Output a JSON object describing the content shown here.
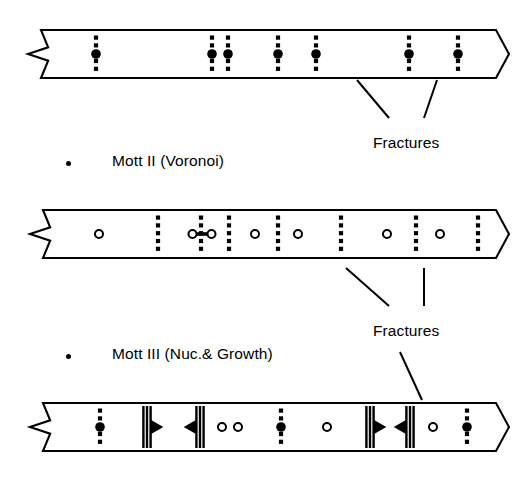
{
  "figure": {
    "background_color": "#ffffff",
    "ink_color": "#000000",
    "width": 521,
    "height": 487
  },
  "labels": {
    "model2": "Mott II  (Voronoi)",
    "model3": "Mott III  (Nuc.& Growth)",
    "fracture_upper": "Fractures",
    "fracture_lower": "Fractures"
  },
  "bands": [
    {
      "id": "band-1",
      "name": "mott-i-band",
      "model": "Mott I",
      "x": 28,
      "y": 30,
      "width": 468,
      "height": 48,
      "left_end": "zigzag-break",
      "right_end": "chevron-break",
      "markers": [
        {
          "type": "dotted-line-with-filled-circle",
          "x": 68
        },
        {
          "type": "dotted-line-with-filled-circle",
          "x": 184
        },
        {
          "type": "dotted-line-with-filled-circle",
          "x": 200
        },
        {
          "type": "dotted-line-with-filled-circle",
          "x": 250
        },
        {
          "type": "dotted-line-with-filled-circle",
          "x": 288
        },
        {
          "type": "dotted-line-with-filled-circle",
          "x": 381
        },
        {
          "type": "dotted-line-with-filled-circle",
          "x": 430
        }
      ]
    },
    {
      "id": "band-2",
      "name": "mott-ii-band",
      "model": "Mott II (Voronoi)",
      "x": 30,
      "y": 210,
      "width": 466,
      "height": 48,
      "left_end": "zigzag-break",
      "right_end": "chevron-break",
      "markers": [
        {
          "type": "open-circle",
          "x": 69
        },
        {
          "type": "dotted-line",
          "x": 128
        },
        {
          "type": "open-circle-pair-linked",
          "x": 172
        },
        {
          "type": "dotted-line",
          "x": 171
        },
        {
          "type": "dotted-line",
          "x": 199
        },
        {
          "type": "open-circle",
          "x": 225
        },
        {
          "type": "dotted-line",
          "x": 248
        },
        {
          "type": "open-circle",
          "x": 268
        },
        {
          "type": "dotted-line",
          "x": 311
        },
        {
          "type": "open-circle",
          "x": 357
        },
        {
          "type": "dotted-line",
          "x": 386
        },
        {
          "type": "open-circle",
          "x": 410
        },
        {
          "type": "dotted-line",
          "x": 448
        }
      ]
    },
    {
      "id": "band-3",
      "name": "mott-iii-band",
      "model": "Mott III (Nuc.& Growth)",
      "x": 30,
      "y": 403,
      "width": 466,
      "height": 48,
      "left_end": "zigzag-break",
      "right_end": "chevron-break",
      "markers": [
        {
          "type": "dotted-line-with-filled-circle",
          "x": 70
        },
        {
          "type": "bar-arrow-right",
          "x": 117
        },
        {
          "type": "bar-arrow-left",
          "x": 170
        },
        {
          "type": "open-circle",
          "x": 192
        },
        {
          "type": "open-circle",
          "x": 208
        },
        {
          "type": "dotted-line-with-filled-circle",
          "x": 251
        },
        {
          "type": "open-circle",
          "x": 297
        },
        {
          "type": "bar-arrow-right",
          "x": 340
        },
        {
          "type": "bar-arrow-left",
          "x": 380
        },
        {
          "type": "open-circle",
          "x": 403
        },
        {
          "type": "dotted-line-with-filled-circle",
          "x": 437
        }
      ]
    }
  ],
  "annotations": {
    "upper_fracture": {
      "label_x": 373,
      "label_y": 134,
      "leaders": [
        {
          "x1": 389,
          "y1": 118,
          "x2": 357,
          "y2": 80
        },
        {
          "x1": 424,
          "y1": 118,
          "x2": 437,
          "y2": 80
        }
      ]
    },
    "lower_fracture": {
      "label_x": 373,
      "label_y": 322,
      "leaders": [
        {
          "x1": 389,
          "y1": 306,
          "x2": 346,
          "y2": 268
        },
        {
          "x1": 424,
          "y1": 306,
          "x2": 424,
          "y2": 268
        },
        {
          "x1": 400,
          "y1": 352,
          "x2": 422,
          "y2": 400
        }
      ]
    }
  },
  "bullets": [
    {
      "name": "bullet-model-2",
      "x": 66,
      "y": 161
    },
    {
      "name": "bullet-model-3",
      "x": 66,
      "y": 354
    }
  ],
  "label_positions": {
    "model2_x": 112,
    "model2_y": 152,
    "model3_x": 112,
    "model3_y": 345
  }
}
